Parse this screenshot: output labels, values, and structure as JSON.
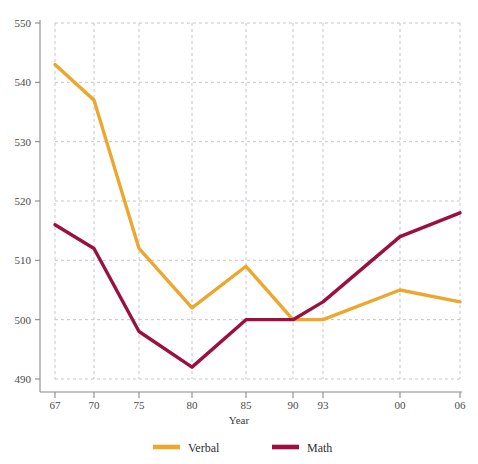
{
  "chart_data": {
    "type": "line",
    "title": "",
    "xlabel": "Year",
    "ylabel": "",
    "x": [
      "67",
      "70",
      "75",
      "80",
      "85",
      "90",
      "93",
      "00",
      "06"
    ],
    "categories": [
      "67",
      "70",
      "75",
      "80",
      "85",
      "90",
      "93",
      "00",
      "06"
    ],
    "xtick_positions": [
      55,
      94,
      139,
      192,
      246,
      293,
      323,
      400,
      460
    ],
    "yticks": [
      490,
      500,
      510,
      520,
      530,
      540,
      550
    ],
    "ylim": [
      488,
      551
    ],
    "grid": true,
    "legend_position": "bottom",
    "series": [
      {
        "name": "Verbal",
        "color": "#ECA72C",
        "values": [
          543,
          537,
          512,
          502,
          509,
          500,
          500,
          505,
          503
        ]
      },
      {
        "name": "Math",
        "color": "#9C1040",
        "values": [
          516,
          512,
          498,
          492,
          500,
          500,
          503,
          514,
          518
        ]
      }
    ]
  },
  "axis": {
    "x_title": "Year",
    "y_tick_labels": [
      "490",
      "500",
      "510",
      "520",
      "530",
      "540",
      "550"
    ],
    "x_tick_labels": [
      "67",
      "70",
      "75",
      "80",
      "85",
      "90",
      "93",
      "00",
      "06"
    ]
  },
  "legend": {
    "items": [
      {
        "label": "Verbal",
        "color": "#ECA72C"
      },
      {
        "label": "Math",
        "color": "#9C1040"
      }
    ]
  },
  "colors": {
    "verbal": "#ECA72C",
    "math": "#9C1040",
    "grid": "#b9bfc9",
    "axis": "#8a8a8a",
    "text": "#3a3a3a",
    "background": "#ffffff"
  }
}
